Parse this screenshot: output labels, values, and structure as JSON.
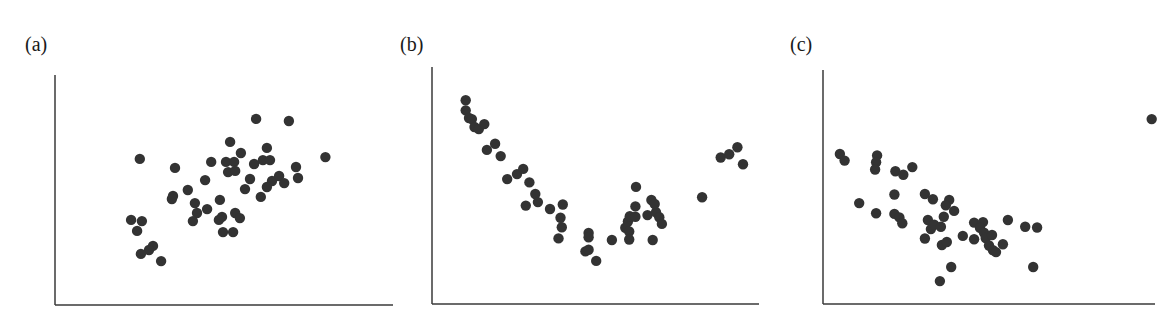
{
  "colors": {
    "point": "#333333",
    "axis": "#3a3a3a",
    "background": "#ffffff"
  },
  "panels": [
    {
      "label": "(a)",
      "label_x": 25
    },
    {
      "label": "(b)",
      "label_x": 400
    },
    {
      "label": "(c)",
      "label_x": 790
    }
  ],
  "chart_data": [
    {
      "type": "scatter",
      "title": "(a)",
      "xlabel": "",
      "ylabel": "",
      "xlim": [
        0,
        10
      ],
      "ylim": [
        0,
        10
      ],
      "grid": false,
      "axes_px": {
        "x0": 55,
        "x1": 393,
        "y0": 305,
        "y1": 75
      },
      "note": "Positive linear association; no tick labels shown",
      "points": [
        [
          5.95,
          8.09
        ],
        [
          6.92,
          8.0
        ],
        [
          5.18,
          7.09
        ],
        [
          6.27,
          6.83
        ],
        [
          2.51,
          6.35
        ],
        [
          5.5,
          6.61
        ],
        [
          8.0,
          6.43
        ],
        [
          4.62,
          6.22
        ],
        [
          5.06,
          6.22
        ],
        [
          5.3,
          6.22
        ],
        [
          5.89,
          6.13
        ],
        [
          6.15,
          6.3
        ],
        [
          6.36,
          6.3
        ],
        [
          3.55,
          5.96
        ],
        [
          5.12,
          5.78
        ],
        [
          5.33,
          5.83
        ],
        [
          7.13,
          6.0
        ],
        [
          7.19,
          5.52
        ],
        [
          4.44,
          5.43
        ],
        [
          5.77,
          5.48
        ],
        [
          6.42,
          5.39
        ],
        [
          6.63,
          5.61
        ],
        [
          6.78,
          5.3
        ],
        [
          6.27,
          5.13
        ],
        [
          5.62,
          5.04
        ],
        [
          6.09,
          4.7
        ],
        [
          3.93,
          5.0
        ],
        [
          3.49,
          4.74
        ],
        [
          3.46,
          4.61
        ],
        [
          4.14,
          4.43
        ],
        [
          4.88,
          4.57
        ],
        [
          4.5,
          4.17
        ],
        [
          4.2,
          4.0
        ],
        [
          4.08,
          3.65
        ],
        [
          5.33,
          4.0
        ],
        [
          5.47,
          3.78
        ],
        [
          4.94,
          3.83
        ],
        [
          4.85,
          3.7
        ],
        [
          4.97,
          3.17
        ],
        [
          5.27,
          3.17
        ],
        [
          2.25,
          3.7
        ],
        [
          2.57,
          3.65
        ],
        [
          2.43,
          3.22
        ],
        [
          2.9,
          2.57
        ],
        [
          2.78,
          2.39
        ],
        [
          2.54,
          2.22
        ],
        [
          3.14,
          1.91
        ]
      ]
    },
    {
      "type": "scatter",
      "title": "(b)",
      "xlabel": "",
      "ylabel": "",
      "xlim": [
        0,
        10
      ],
      "ylim": [
        0,
        10
      ],
      "grid": false,
      "axes_px": {
        "x0": 432,
        "x1": 759,
        "y0": 304,
        "y1": 67
      },
      "note": "U-shaped (quadratic) nonlinear association; no tick labels shown",
      "points": [
        [
          1.03,
          8.6
        ],
        [
          1.03,
          8.17
        ],
        [
          1.13,
          7.85
        ],
        [
          1.22,
          7.8
        ],
        [
          1.3,
          7.47
        ],
        [
          1.43,
          7.38
        ],
        [
          1.6,
          7.59
        ],
        [
          1.68,
          6.5
        ],
        [
          1.93,
          6.76
        ],
        [
          2.1,
          6.24
        ],
        [
          2.3,
          5.27
        ],
        [
          2.6,
          5.48
        ],
        [
          2.79,
          5.7
        ],
        [
          2.98,
          5.13
        ],
        [
          3.16,
          4.64
        ],
        [
          2.87,
          4.15
        ],
        [
          3.24,
          4.3
        ],
        [
          3.61,
          4.01
        ],
        [
          4.0,
          4.2
        ],
        [
          3.93,
          3.64
        ],
        [
          3.97,
          3.24
        ],
        [
          3.87,
          2.77
        ],
        [
          4.79,
          3.0
        ],
        [
          4.79,
          2.82
        ],
        [
          4.69,
          2.22
        ],
        [
          4.79,
          2.29
        ],
        [
          5.02,
          1.82
        ],
        [
          5.5,
          2.7
        ],
        [
          5.99,
          3.48
        ],
        [
          6.05,
          3.7
        ],
        [
          5.91,
          3.22
        ],
        [
          6.03,
          3.06
        ],
        [
          6.03,
          2.72
        ],
        [
          6.22,
          4.12
        ],
        [
          6.24,
          4.94
        ],
        [
          6.22,
          3.68
        ],
        [
          6.71,
          4.39
        ],
        [
          6.59,
          3.75
        ],
        [
          6.85,
          3.87
        ],
        [
          6.81,
          4.22
        ],
        [
          6.95,
          3.66
        ],
        [
          7.03,
          3.38
        ],
        [
          6.75,
          2.7
        ],
        [
          8.26,
          4.5
        ],
        [
          8.83,
          6.18
        ],
        [
          9.09,
          6.32
        ],
        [
          9.34,
          6.61
        ],
        [
          9.51,
          5.9
        ]
      ]
    },
    {
      "type": "scatter",
      "title": "(c)",
      "xlabel": "",
      "ylabel": "",
      "xlim": [
        0,
        10
      ],
      "ylim": [
        0,
        10
      ],
      "grid": false,
      "axes_px": {
        "x0": 823,
        "x1": 1155,
        "y0": 304,
        "y1": 70
      },
      "note": "Negative association with one outlier at upper right; no tick labels shown",
      "points": [
        [
          0.51,
          6.41
        ],
        [
          0.65,
          6.13
        ],
        [
          1.63,
          6.35
        ],
        [
          1.6,
          6.06
        ],
        [
          1.57,
          5.75
        ],
        [
          2.18,
          5.67
        ],
        [
          2.42,
          5.52
        ],
        [
          2.69,
          5.85
        ],
        [
          2.15,
          4.68
        ],
        [
          1.09,
          4.31
        ],
        [
          1.6,
          3.88
        ],
        [
          2.15,
          3.85
        ],
        [
          2.3,
          3.7
        ],
        [
          2.39,
          3.45
        ],
        [
          3.07,
          4.7
        ],
        [
          3.31,
          4.48
        ],
        [
          3.8,
          4.45
        ],
        [
          3.7,
          4.22
        ],
        [
          3.95,
          3.98
        ],
        [
          3.64,
          3.73
        ],
        [
          3.16,
          3.59
        ],
        [
          3.25,
          3.2
        ],
        [
          3.35,
          3.39
        ],
        [
          3.55,
          3.3
        ],
        [
          3.07,
          2.8
        ],
        [
          3.58,
          2.52
        ],
        [
          3.73,
          2.65
        ],
        [
          4.21,
          2.91
        ],
        [
          4.55,
          2.77
        ],
        [
          4.55,
          3.48
        ],
        [
          4.82,
          3.5
        ],
        [
          4.73,
          3.25
        ],
        [
          4.85,
          3.05
        ],
        [
          4.9,
          2.82
        ],
        [
          5.09,
          2.95
        ],
        [
          5.0,
          2.5
        ],
        [
          5.12,
          2.3
        ],
        [
          5.21,
          2.22
        ],
        [
          5.57,
          3.59
        ],
        [
          5.42,
          2.55
        ],
        [
          6.09,
          3.3
        ],
        [
          6.45,
          3.27
        ],
        [
          3.86,
          1.58
        ],
        [
          3.52,
          0.98
        ],
        [
          6.33,
          1.58
        ],
        [
          9.9,
          7.9
        ]
      ]
    }
  ]
}
